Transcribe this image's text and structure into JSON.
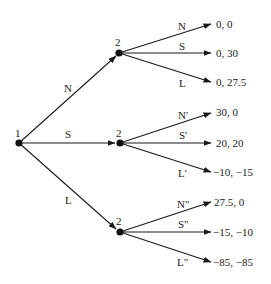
{
  "diagram": {
    "type": "game-tree",
    "root": {
      "player": "1",
      "x": 19,
      "y": 143
    },
    "first_moves": [
      {
        "label": "N",
        "label_x": 68,
        "label_y": 93
      },
      {
        "label": "S",
        "label_x": 68,
        "label_y": 138
      },
      {
        "label": "L",
        "label_x": 68,
        "label_y": 203
      }
    ],
    "subgames": [
      {
        "player": "2",
        "x": 119,
        "y": 53,
        "branches": [
          {
            "label": "N",
            "payoff": "0, 0",
            "tip_y": 24
          },
          {
            "label": "S",
            "payoff": "0, 30",
            "tip_y": 53
          },
          {
            "label": "L",
            "payoff": "0, 27.5",
            "tip_y": 82
          }
        ]
      },
      {
        "player": "2",
        "x": 119,
        "y": 143,
        "branches": [
          {
            "label": "N'",
            "payoff": "30, 0",
            "tip_y": 113
          },
          {
            "label": "S'",
            "payoff": "20, 20",
            "tip_y": 143
          },
          {
            "label": "L'",
            "payoff": "−10, −15",
            "tip_y": 172
          }
        ]
      },
      {
        "player": "2",
        "x": 119,
        "y": 232,
        "branches": [
          {
            "label": "N\"",
            "payoff": "27.5, 0",
            "tip_y": 202
          },
          {
            "label": "S\"",
            "payoff": "−15, −10",
            "tip_y": 232
          },
          {
            "label": "L\"",
            "payoff": "−85, −85",
            "tip_y": 262
          }
        ]
      }
    ]
  }
}
